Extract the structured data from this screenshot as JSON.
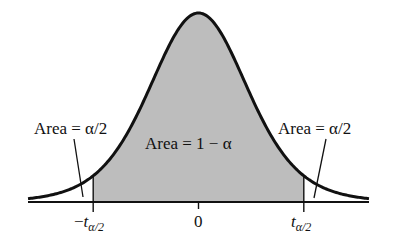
{
  "chart_data": {
    "type": "area",
    "title": "",
    "distribution": "t",
    "xlim": [
      -3.4,
      3.4
    ],
    "critical_value_symbol": "t",
    "critical_value_subscript": "α/2",
    "critical_value_approx": 2.1,
    "ticks": [
      {
        "value": -2.1,
        "label_prefix": "−",
        "label_main": "t",
        "label_sub": "α/2"
      },
      {
        "value": 0,
        "label_prefix": "",
        "label_main": "0",
        "label_sub": ""
      },
      {
        "value": 2.1,
        "label_prefix": "",
        "label_main": "t",
        "label_sub": "α/2"
      }
    ],
    "regions": [
      {
        "name": "left-tail",
        "from": -3.4,
        "to": -2.1,
        "shaded": false,
        "label": "Area = α/2"
      },
      {
        "name": "center",
        "from": -2.1,
        "to": 2.1,
        "shaded": true,
        "label": "Area = 1 − α"
      },
      {
        "name": "right-tail",
        "from": 2.1,
        "to": 3.4,
        "shaded": false,
        "label": "Area = α/2"
      }
    ],
    "colors": {
      "curve": "#111111",
      "shade": "#bdbdbd",
      "axis": "#111111"
    }
  }
}
